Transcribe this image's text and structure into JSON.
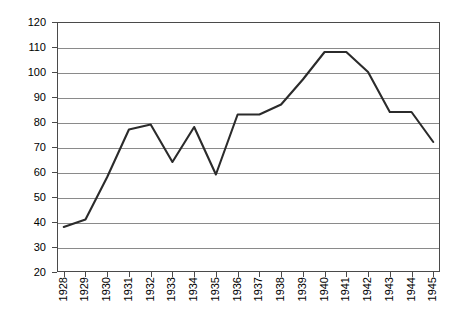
{
  "chart_data": {
    "type": "line",
    "title": "",
    "subtitle": "",
    "xlabel": "",
    "ylabel": "",
    "categories": [
      "1928",
      "1929",
      "1930",
      "1931",
      "1932",
      "1933",
      "1934",
      "1935",
      "1936",
      "1937",
      "1938",
      "1939",
      "1940",
      "1941",
      "1942",
      "1943",
      "1944",
      "1945"
    ],
    "values": [
      38,
      41,
      58,
      77,
      79,
      64,
      78,
      59,
      83,
      83,
      87,
      97,
      108,
      108,
      100,
      84,
      84,
      72
    ],
    "series": [
      {
        "name": "series-1",
        "values": [
          38,
          41,
          58,
          77,
          79,
          64,
          78,
          59,
          83,
          83,
          87,
          97,
          108,
          108,
          100,
          84,
          84,
          72
        ]
      }
    ],
    "ylim": [
      20,
      120
    ],
    "xlim": [
      "1928",
      "1945"
    ],
    "ytick_labels": [
      "20",
      "30",
      "40",
      "50",
      "60",
      "70",
      "80",
      "90",
      "100",
      "110",
      "120"
    ],
    "ytick_values": [
      20,
      30,
      40,
      50,
      60,
      70,
      80,
      90,
      100,
      110,
      120
    ],
    "grid": true,
    "grid_axis": "y",
    "legend": false,
    "legend_position": "none",
    "line_color": "#2b2b2b",
    "grid_color": "#8a8a8a",
    "frame_color": "#4a4a4a",
    "background_color": "#ffffff",
    "markers": false,
    "annotations": []
  }
}
